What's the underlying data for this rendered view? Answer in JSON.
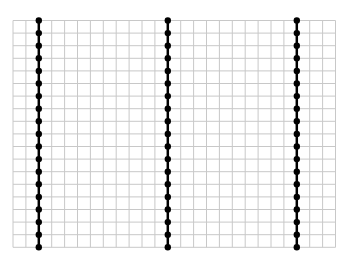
{
  "diagram": {
    "type": "dot-grid-lines",
    "background": "#ffffff",
    "grid": {
      "left": 13,
      "top": 20.5,
      "columns": 25,
      "rows": 18,
      "cell_width": 12.9,
      "cell_height": 12.6,
      "line_color": "#c8c8c8",
      "line_width": 1
    },
    "vertical_lines": [
      {
        "column_index": 2
      },
      {
        "column_index": 12
      },
      {
        "column_index": 22
      }
    ],
    "line_color": "#000000",
    "line_width": 2.5,
    "dot_color": "#000000",
    "dot_radius": 3.2,
    "dots_per_line": 19
  }
}
